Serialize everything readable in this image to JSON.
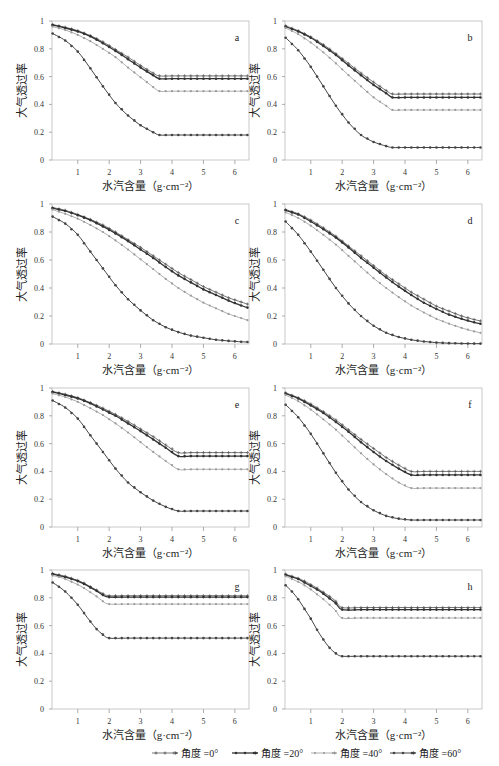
{
  "chart_data": [
    {
      "type": "line",
      "panel": "a",
      "xlim": [
        0.18,
        6.45
      ],
      "ylim": [
        0,
        1
      ],
      "xlabel": "水汽含量（g·cm⁻²）",
      "ylabel": "大气透过率",
      "xticks": [
        1,
        2,
        3,
        4,
        5,
        6
      ],
      "yticks": [
        0,
        0.2,
        0.4,
        0.6,
        0.8,
        1
      ],
      "ytick_labels": [
        "0",
        "0.2",
        "0.4",
        "0.6",
        "0.8",
        "1"
      ],
      "x": [
        0.2,
        0.6,
        1.0,
        1.4,
        1.8,
        2.2,
        2.6,
        3.0,
        3.4,
        3.6,
        4.0,
        4.4,
        4.8,
        5.2,
        5.6,
        6.0,
        6.4
      ],
      "series": [
        {
          "name": "角度 =0°",
          "values": [
            0.975,
            0.955,
            0.93,
            0.895,
            0.85,
            0.795,
            0.74,
            0.68,
            0.625,
            0.605,
            0.605,
            0.605,
            0.605,
            0.605,
            0.605,
            0.605,
            0.605
          ]
        },
        {
          "name": "角度 =20°",
          "values": [
            0.97,
            0.95,
            0.925,
            0.89,
            0.84,
            0.785,
            0.725,
            0.665,
            0.61,
            0.585,
            0.585,
            0.585,
            0.585,
            0.585,
            0.585,
            0.585,
            0.585
          ]
        },
        {
          "name": "角度 =40°",
          "values": [
            0.96,
            0.935,
            0.9,
            0.855,
            0.8,
            0.74,
            0.665,
            0.595,
            0.525,
            0.495,
            0.495,
            0.495,
            0.495,
            0.495,
            0.495,
            0.495,
            0.495
          ]
        },
        {
          "name": "角度 =60°",
          "values": [
            0.91,
            0.86,
            0.78,
            0.66,
            0.53,
            0.41,
            0.32,
            0.25,
            0.2,
            0.18,
            0.18,
            0.18,
            0.18,
            0.18,
            0.18,
            0.18,
            0.18
          ]
        }
      ]
    },
    {
      "type": "line",
      "panel": "b",
      "xlim": [
        0.18,
        6.45
      ],
      "ylim": [
        0,
        1
      ],
      "xlabel": "水汽含量（g·cm⁻²）",
      "ylabel": "大气透过率",
      "xticks": [
        1,
        2,
        3,
        4,
        5,
        6
      ],
      "yticks": [
        0,
        0.2,
        0.4,
        0.6,
        0.8,
        1
      ],
      "ytick_labels": [
        "0",
        "0.2",
        "0.4",
        "0.6",
        "0.8",
        "1"
      ],
      "x": [
        0.2,
        0.6,
        1.0,
        1.4,
        1.8,
        2.2,
        2.6,
        3.0,
        3.4,
        3.6,
        4.0,
        4.4,
        4.8,
        5.2,
        5.6,
        6.0,
        6.4
      ],
      "series": [
        {
          "name": "角度 =0°",
          "values": [
            0.965,
            0.93,
            0.885,
            0.83,
            0.765,
            0.695,
            0.625,
            0.56,
            0.5,
            0.475,
            0.475,
            0.475,
            0.475,
            0.475,
            0.475,
            0.475,
            0.475
          ]
        },
        {
          "name": "角度 =20°",
          "values": [
            0.96,
            0.925,
            0.88,
            0.82,
            0.755,
            0.68,
            0.61,
            0.54,
            0.48,
            0.45,
            0.45,
            0.45,
            0.45,
            0.45,
            0.45,
            0.45,
            0.45
          ]
        },
        {
          "name": "角度 =40°",
          "values": [
            0.95,
            0.905,
            0.845,
            0.775,
            0.695,
            0.61,
            0.53,
            0.45,
            0.39,
            0.36,
            0.36,
            0.36,
            0.36,
            0.36,
            0.36,
            0.36,
            0.36
          ]
        },
        {
          "name": "角度 =60°",
          "values": [
            0.88,
            0.79,
            0.67,
            0.53,
            0.39,
            0.27,
            0.18,
            0.13,
            0.1,
            0.09,
            0.09,
            0.09,
            0.09,
            0.09,
            0.09,
            0.09,
            0.09
          ]
        }
      ]
    },
    {
      "type": "line",
      "panel": "c",
      "xlim": [
        0.18,
        6.45
      ],
      "ylim": [
        0,
        1
      ],
      "xlabel": "水汽含量（g·cm⁻²）",
      "ylabel": "大气透过率",
      "xticks": [
        1,
        2,
        3,
        4,
        5,
        6
      ],
      "yticks": [
        0,
        0.2,
        0.4,
        0.6,
        0.8,
        1
      ],
      "ytick_labels": [
        "0",
        "0.2",
        "0.4",
        "0.6",
        "0.8",
        "1"
      ],
      "x": [
        0.2,
        0.6,
        1.0,
        1.4,
        1.8,
        2.2,
        2.6,
        3.0,
        3.4,
        3.8,
        4.2,
        4.6,
        5.0,
        5.4,
        5.8,
        6.2,
        6.4
      ],
      "series": [
        {
          "name": "角度 =0°",
          "values": [
            0.975,
            0.955,
            0.925,
            0.89,
            0.85,
            0.8,
            0.745,
            0.69,
            0.63,
            0.57,
            0.51,
            0.46,
            0.41,
            0.37,
            0.33,
            0.3,
            0.285
          ]
        },
        {
          "name": "角度 =20°",
          "values": [
            0.97,
            0.95,
            0.92,
            0.885,
            0.84,
            0.79,
            0.735,
            0.675,
            0.615,
            0.55,
            0.49,
            0.44,
            0.39,
            0.35,
            0.31,
            0.275,
            0.26
          ]
        },
        {
          "name": "角度 =40°",
          "values": [
            0.96,
            0.93,
            0.895,
            0.85,
            0.8,
            0.74,
            0.675,
            0.605,
            0.535,
            0.465,
            0.4,
            0.345,
            0.295,
            0.255,
            0.215,
            0.185,
            0.17
          ]
        },
        {
          "name": "角度 =60°",
          "values": [
            0.91,
            0.86,
            0.78,
            0.66,
            0.54,
            0.42,
            0.32,
            0.24,
            0.17,
            0.12,
            0.085,
            0.06,
            0.045,
            0.03,
            0.022,
            0.016,
            0.014
          ]
        }
      ]
    },
    {
      "type": "line",
      "panel": "d",
      "xlim": [
        0.18,
        6.45
      ],
      "ylim": [
        0,
        1
      ],
      "xlabel": "水汽含量（g·cm⁻²）",
      "ylabel": "大气透过率",
      "xticks": [
        1,
        2,
        3,
        4,
        5,
        6
      ],
      "yticks": [
        0,
        0.2,
        0.4,
        0.6,
        0.8,
        1
      ],
      "ytick_labels": [
        "0",
        "0.2",
        "0.4",
        "0.6",
        "0.8",
        "1"
      ],
      "x": [
        0.2,
        0.6,
        1.0,
        1.4,
        1.8,
        2.2,
        2.6,
        3.0,
        3.4,
        3.8,
        4.2,
        4.6,
        5.0,
        5.4,
        5.8,
        6.2,
        6.4
      ],
      "series": [
        {
          "name": "角度 =0°",
          "values": [
            0.96,
            0.93,
            0.885,
            0.83,
            0.77,
            0.7,
            0.63,
            0.56,
            0.49,
            0.43,
            0.37,
            0.32,
            0.27,
            0.235,
            0.2,
            0.175,
            0.165
          ]
        },
        {
          "name": "角度 =20°",
          "values": [
            0.955,
            0.925,
            0.875,
            0.82,
            0.76,
            0.69,
            0.615,
            0.545,
            0.475,
            0.41,
            0.35,
            0.295,
            0.25,
            0.21,
            0.18,
            0.155,
            0.145
          ]
        },
        {
          "name": "角度 =40°",
          "values": [
            0.94,
            0.9,
            0.845,
            0.78,
            0.71,
            0.63,
            0.55,
            0.47,
            0.4,
            0.335,
            0.275,
            0.225,
            0.18,
            0.145,
            0.115,
            0.09,
            0.08
          ]
        },
        {
          "name": "角度 =60°",
          "values": [
            0.875,
            0.78,
            0.66,
            0.53,
            0.4,
            0.29,
            0.2,
            0.13,
            0.08,
            0.05,
            0.03,
            0.018,
            0.01,
            0.006,
            0.004,
            0.003,
            0.003
          ]
        }
      ]
    },
    {
      "type": "line",
      "panel": "e",
      "xlim": [
        0.18,
        6.45
      ],
      "ylim": [
        0,
        1
      ],
      "xlabel": "水汽含量（g·cm⁻²）",
      "ylabel": "大气透过率",
      "xticks": [
        1,
        2,
        3,
        4,
        5,
        6
      ],
      "yticks": [
        0,
        0.2,
        0.4,
        0.6,
        0.8,
        1
      ],
      "ytick_labels": [
        "0",
        "0.2",
        "0.4",
        "0.6",
        "0.8",
        "1"
      ],
      "x": [
        0.2,
        0.6,
        1.0,
        1.4,
        1.8,
        2.2,
        2.6,
        3.0,
        3.4,
        3.8,
        4.2,
        4.6,
        5.0,
        5.4,
        5.8,
        6.2,
        6.4
      ],
      "series": [
        {
          "name": "角度 =0°",
          "values": [
            0.975,
            0.955,
            0.93,
            0.895,
            0.855,
            0.81,
            0.76,
            0.705,
            0.65,
            0.59,
            0.535,
            0.535,
            0.535,
            0.535,
            0.535,
            0.535,
            0.535
          ]
        },
        {
          "name": "角度 =20°",
          "values": [
            0.97,
            0.95,
            0.925,
            0.89,
            0.845,
            0.8,
            0.745,
            0.69,
            0.63,
            0.57,
            0.51,
            0.51,
            0.51,
            0.51,
            0.51,
            0.51,
            0.51
          ]
        },
        {
          "name": "角度 =40°",
          "values": [
            0.96,
            0.935,
            0.9,
            0.855,
            0.805,
            0.745,
            0.68,
            0.61,
            0.54,
            0.475,
            0.415,
            0.415,
            0.415,
            0.415,
            0.415,
            0.415,
            0.415
          ]
        },
        {
          "name": "角度 =60°",
          "values": [
            0.91,
            0.86,
            0.78,
            0.66,
            0.54,
            0.42,
            0.32,
            0.25,
            0.19,
            0.145,
            0.115,
            0.115,
            0.115,
            0.115,
            0.115,
            0.115,
            0.115
          ]
        }
      ]
    },
    {
      "type": "line",
      "panel": "f",
      "xlim": [
        0.18,
        6.45
      ],
      "ylim": [
        0,
        1
      ],
      "xlabel": "水汽含量（g·cm⁻²）",
      "ylabel": "大气透过率",
      "xticks": [
        1,
        2,
        3,
        4,
        5,
        6
      ],
      "yticks": [
        0,
        0.2,
        0.4,
        0.6,
        0.8,
        1
      ],
      "ytick_labels": [
        "0",
        "0.2",
        "0.4",
        "0.6",
        "0.8",
        "1"
      ],
      "x": [
        0.2,
        0.6,
        1.0,
        1.4,
        1.8,
        2.2,
        2.6,
        3.0,
        3.4,
        3.8,
        4.2,
        4.6,
        5.0,
        5.4,
        5.8,
        6.2,
        6.4
      ],
      "series": [
        {
          "name": "角度 =0°",
          "values": [
            0.965,
            0.93,
            0.885,
            0.83,
            0.77,
            0.7,
            0.63,
            0.565,
            0.5,
            0.445,
            0.4,
            0.4,
            0.4,
            0.4,
            0.4,
            0.4,
            0.4
          ]
        },
        {
          "name": "角度 =20°",
          "values": [
            0.96,
            0.925,
            0.875,
            0.82,
            0.755,
            0.685,
            0.61,
            0.54,
            0.475,
            0.42,
            0.375,
            0.375,
            0.375,
            0.375,
            0.375,
            0.375,
            0.375
          ]
        },
        {
          "name": "角度 =40°",
          "values": [
            0.95,
            0.905,
            0.845,
            0.775,
            0.7,
            0.615,
            0.53,
            0.45,
            0.38,
            0.32,
            0.28,
            0.28,
            0.28,
            0.28,
            0.28,
            0.28,
            0.28
          ]
        },
        {
          "name": "角度 =60°",
          "values": [
            0.88,
            0.79,
            0.67,
            0.53,
            0.39,
            0.27,
            0.18,
            0.12,
            0.08,
            0.06,
            0.05,
            0.05,
            0.05,
            0.05,
            0.05,
            0.05,
            0.05
          ]
        }
      ]
    },
    {
      "type": "line",
      "panel": "g",
      "xlim": [
        0.18,
        6.45
      ],
      "ylim": [
        0,
        1
      ],
      "xlabel": "水汽含量（g·cm⁻²）",
      "ylabel": "大气透过率",
      "xticks": [
        1,
        2,
        3,
        4,
        5,
        6
      ],
      "yticks": [
        0,
        0.2,
        0.4,
        0.6,
        0.8,
        1
      ],
      "ytick_labels": [
        "0",
        "0.2",
        "0.4",
        "0.6",
        "0.8",
        "1"
      ],
      "x": [
        0.2,
        0.4,
        0.6,
        0.8,
        1.0,
        1.2,
        1.4,
        1.6,
        1.8,
        2.0,
        2.6,
        3.2,
        3.8,
        4.4,
        5.0,
        5.6,
        6.2,
        6.4
      ],
      "series": [
        {
          "name": "角度 =0°",
          "values": [
            0.975,
            0.965,
            0.955,
            0.94,
            0.925,
            0.905,
            0.88,
            0.855,
            0.83,
            0.815,
            0.815,
            0.815,
            0.815,
            0.815,
            0.815,
            0.815,
            0.815,
            0.815
          ]
        },
        {
          "name": "角度 =20°",
          "values": [
            0.97,
            0.96,
            0.95,
            0.935,
            0.92,
            0.9,
            0.875,
            0.85,
            0.82,
            0.805,
            0.805,
            0.805,
            0.805,
            0.805,
            0.805,
            0.805,
            0.805,
            0.805
          ]
        },
        {
          "name": "角度 =40°",
          "values": [
            0.96,
            0.95,
            0.935,
            0.915,
            0.895,
            0.87,
            0.84,
            0.81,
            0.775,
            0.755,
            0.755,
            0.755,
            0.755,
            0.755,
            0.755,
            0.755,
            0.755,
            0.755
          ]
        },
        {
          "name": "角度 =60°",
          "values": [
            0.91,
            0.88,
            0.845,
            0.8,
            0.75,
            0.69,
            0.63,
            0.575,
            0.535,
            0.51,
            0.51,
            0.51,
            0.51,
            0.51,
            0.51,
            0.51,
            0.51,
            0.51
          ]
        }
      ]
    },
    {
      "type": "line",
      "panel": "h",
      "xlim": [
        0.18,
        6.45
      ],
      "ylim": [
        0,
        1
      ],
      "xlabel": "水汽含量（g·cm⁻²）",
      "ylabel": "大气透过率",
      "xticks": [
        1,
        2,
        3,
        4,
        5,
        6
      ],
      "yticks": [
        0,
        0.2,
        0.4,
        0.6,
        0.8,
        1
      ],
      "ytick_labels": [
        "0",
        "0.2",
        "0.4",
        "0.6",
        "0.8",
        "1"
      ],
      "x": [
        0.2,
        0.4,
        0.6,
        0.8,
        1.0,
        1.2,
        1.4,
        1.6,
        1.8,
        2.0,
        2.6,
        3.2,
        3.8,
        4.4,
        5.0,
        5.6,
        6.2,
        6.4
      ],
      "series": [
        {
          "name": "角度 =0°",
          "values": [
            0.97,
            0.955,
            0.94,
            0.92,
            0.895,
            0.87,
            0.84,
            0.81,
            0.775,
            0.73,
            0.73,
            0.73,
            0.73,
            0.73,
            0.73,
            0.73,
            0.73,
            0.73
          ]
        },
        {
          "name": "角度 =20°",
          "values": [
            0.965,
            0.95,
            0.935,
            0.91,
            0.885,
            0.86,
            0.83,
            0.795,
            0.76,
            0.715,
            0.715,
            0.715,
            0.715,
            0.715,
            0.715,
            0.715,
            0.715,
            0.715
          ]
        },
        {
          "name": "角度 =40°",
          "values": [
            0.955,
            0.935,
            0.915,
            0.89,
            0.86,
            0.825,
            0.79,
            0.75,
            0.705,
            0.655,
            0.655,
            0.655,
            0.655,
            0.655,
            0.655,
            0.655,
            0.655,
            0.655
          ]
        },
        {
          "name": "角度 =60°",
          "values": [
            0.89,
            0.845,
            0.79,
            0.72,
            0.65,
            0.57,
            0.5,
            0.44,
            0.4,
            0.38,
            0.38,
            0.38,
            0.38,
            0.38,
            0.38,
            0.38,
            0.38,
            0.38
          ]
        }
      ]
    }
  ],
  "legend": {
    "placement": "bottom",
    "items": [
      {
        "label": "角度 =0°",
        "style": "plus",
        "color": "#555555"
      },
      {
        "label": "角度 =20°",
        "style": "dot-line",
        "color": "#333333"
      },
      {
        "label": "角度 =40°",
        "style": "light",
        "color": "#999999"
      },
      {
        "label": "角度 =60°",
        "style": "dot-line",
        "color": "#444444"
      }
    ]
  },
  "colors": {
    "axis": "#aaaaaa",
    "s0": "#555555",
    "s20": "#333333",
    "s40": "#9a9a9a",
    "s60": "#444444"
  }
}
